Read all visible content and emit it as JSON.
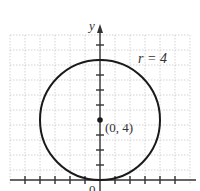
{
  "diagram": {
    "type": "circle-on-coordinate-plane",
    "y_axis_label": "y",
    "origin_label": "0",
    "radius_label": "r = 4",
    "center_label": "(0, 4)",
    "center": [
      0,
      4
    ],
    "radius": 4,
    "colors": {
      "circle": "#1a1a1a",
      "axis": "#333333",
      "grid": "#c8c8c8",
      "text": "#333333"
    }
  }
}
